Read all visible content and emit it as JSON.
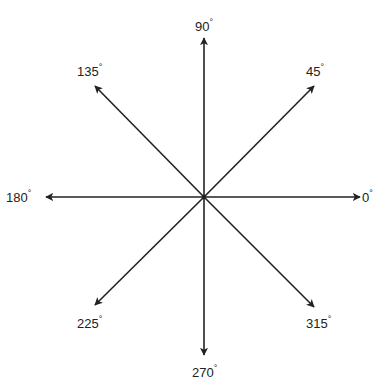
{
  "diagram": {
    "center": [
      204,
      197
    ],
    "line_color": "#222222",
    "directions": [
      {
        "angle": 0,
        "label": "0",
        "unit": "°",
        "tip": [
          360,
          197
        ],
        "label_pos": [
          362,
          188
        ]
      },
      {
        "angle": 45,
        "label": "45",
        "unit": "°",
        "tip": [
          314,
          86
        ],
        "label_pos": [
          306,
          62
        ]
      },
      {
        "angle": 90,
        "label": "90",
        "unit": "°",
        "tip": [
          204,
          38
        ],
        "label_pos": [
          195,
          17
        ]
      },
      {
        "angle": 135,
        "label": "135",
        "unit": "°",
        "tip": [
          95,
          86
        ],
        "label_pos": [
          77,
          62
        ]
      },
      {
        "angle": 180,
        "label": "180",
        "unit": "°",
        "tip": [
          46,
          197
        ],
        "label_pos": [
          6,
          188
        ]
      },
      {
        "angle": 225,
        "label": "225",
        "unit": "°",
        "tip": [
          95,
          305
        ],
        "label_pos": [
          77,
          314
        ]
      },
      {
        "angle": 270,
        "label": "270",
        "unit": "°",
        "tip": [
          204,
          355
        ],
        "label_pos": [
          192,
          363
        ]
      },
      {
        "angle": 315,
        "label": "315",
        "unit": "°",
        "tip": [
          314,
          307
        ],
        "label_pos": [
          306,
          314
        ]
      }
    ]
  }
}
